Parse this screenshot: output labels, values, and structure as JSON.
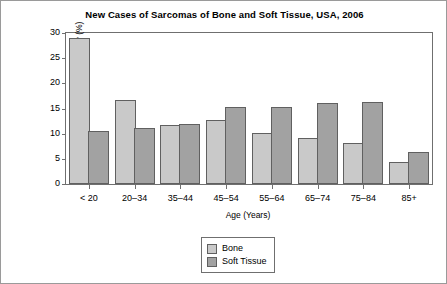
{
  "chart_data": {
    "type": "bar",
    "title": "New Cases of Sarcomas of Bone and Soft Tissue, USA, 2006",
    "xlabel": "Age (Years)",
    "ylabel": "Relative Frequency (%)",
    "categories": [
      "< 20",
      "20–34",
      "35–44",
      "45–54",
      "55–64",
      "65–74",
      "75–84",
      "85+"
    ],
    "series": [
      {
        "name": "Bone",
        "color": "#c9c9c9",
        "values": [
          29,
          16.7,
          11.7,
          12.7,
          10.1,
          9.1,
          8.2,
          4.4
        ]
      },
      {
        "name": "Soft Tissue",
        "color": "#a2a2a2",
        "values": [
          10.6,
          11.1,
          11.9,
          15.3,
          15.3,
          16.0,
          16.3,
          6.4
        ]
      }
    ],
    "ylim": [
      0,
      30
    ],
    "yticks": [
      0,
      5,
      10,
      15,
      20,
      25,
      30
    ],
    "ytick_labels": [
      "0",
      "5",
      "10",
      "15",
      "20",
      "25",
      "30"
    ],
    "grid": false,
    "legend_position": "bottom-center"
  }
}
